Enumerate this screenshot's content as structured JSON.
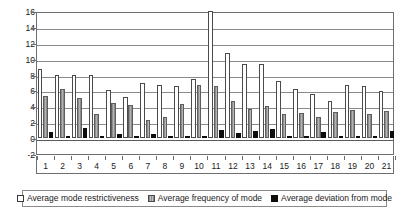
{
  "chart_data": {
    "type": "bar",
    "title": "",
    "xlabel": "",
    "ylabel": "",
    "ylim": [
      -2,
      16
    ],
    "yticks": [
      16,
      14,
      12,
      10,
      8,
      6,
      4,
      2,
      0,
      -2
    ],
    "grid": true,
    "legend_position": "bottom",
    "categories": [
      "1",
      "2",
      "3",
      "4",
      "5",
      "6",
      "7",
      "8",
      "9",
      "10",
      "11",
      "12",
      "13",
      "14",
      "15",
      "16",
      "17",
      "18",
      "19",
      "20",
      "21"
    ],
    "series": [
      {
        "name": "Average mode restrictiveness",
        "color": "#ffffff",
        "values": [
          8.7,
          8.0,
          8.0,
          8.0,
          6.0,
          5.2,
          6.9,
          6.7,
          6.6,
          7.4,
          16.0,
          10.7,
          9.3,
          9.3,
          7.2,
          6.2,
          5.6,
          4.7,
          6.7,
          6.6,
          5.9
        ]
      },
      {
        "name": "Average frequency of mode",
        "color": "#9a9a9a",
        "values": [
          5.3,
          6.2,
          5.0,
          3.0,
          4.4,
          4.2,
          2.3,
          2.6,
          4.3,
          6.7,
          6.6,
          4.7,
          3.7,
          4.0,
          3.0,
          3.2,
          2.7,
          3.3,
          3.5,
          3.0,
          3.4
        ]
      },
      {
        "name": "Average deviation from mode",
        "color": "#0d0d0d",
        "values": [
          0.8,
          0.1,
          1.3,
          0.1,
          0.5,
          0.2,
          0.5,
          0.1,
          0.1,
          0.1,
          1.0,
          0.6,
          0.9,
          1.2,
          0.2,
          0.1,
          0.8,
          0.2,
          0.1,
          0.3,
          0.9
        ]
      }
    ]
  },
  "legend": {
    "items": [
      {
        "label": "Average mode restrictiveness",
        "swatch": "hollow-white-square"
      },
      {
        "label": "Average frequency of mode",
        "swatch": "gray-hatched-square"
      },
      {
        "label": "Average deviation from mode",
        "swatch": "solid-black-square"
      }
    ]
  }
}
